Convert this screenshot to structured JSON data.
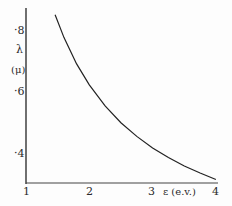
{
  "chart_data": {
    "type": "line",
    "title": "",
    "xlabel": "ε (e.v.)",
    "ylabel": "λ (μ)",
    "ylabel_line1": "λ",
    "ylabel_line2": "(μ)",
    "xlim": [
      1,
      4
    ],
    "ylim": [
      0.3,
      0.85
    ],
    "x_ticks": [
      "1",
      "2",
      "3",
      "4"
    ],
    "y_ticks": [
      "·8",
      "·6",
      "·4"
    ],
    "grid": false,
    "series": [
      {
        "name": "λ = 1.24/ε",
        "x": [
          1.46,
          1.6,
          1.8,
          2.0,
          2.25,
          2.5,
          2.75,
          3.0,
          3.25,
          3.5,
          3.75,
          4.0
        ],
        "y": [
          0.85,
          0.775,
          0.689,
          0.62,
          0.551,
          0.496,
          0.451,
          0.413,
          0.382,
          0.354,
          0.331,
          0.31
        ]
      }
    ]
  }
}
